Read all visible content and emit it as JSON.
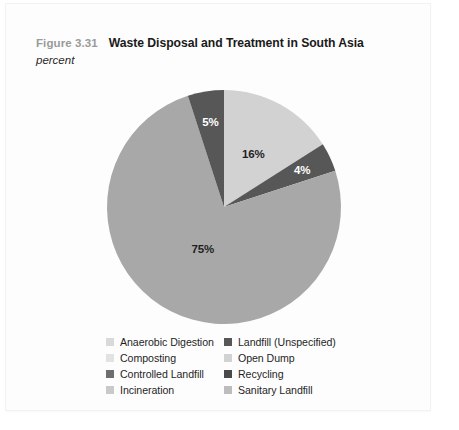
{
  "figure": {
    "number": "Figure 3.31",
    "title": "Waste Disposal and Treatment in South Asia",
    "subtitle": "percent"
  },
  "colors": {
    "light_gray": "#d2d2d2",
    "medium_gray": "#a8a8a8",
    "dark_gray": "#575757",
    "pale_gray": "#cccccc",
    "text_dark": "#1f1f1f",
    "text_gray": "#9a9a9a",
    "background": "#ffffff"
  },
  "chart_data": {
    "type": "pie",
    "title": "Waste Disposal and Treatment in South Asia",
    "subtitle": "percent",
    "units": "percent",
    "start_angle": 0,
    "direction": "clockwise",
    "legend_position": "bottom",
    "labels": [
      "Open Dump",
      "Recycling",
      "Sanitary Landfill",
      "Landfill (Unspecified)"
    ],
    "values": [
      16,
      4,
      75,
      5
    ],
    "slices": [
      {
        "label": "Open Dump",
        "value": 16,
        "display": "16%",
        "color": "#d2d2d2",
        "label_color": "dark"
      },
      {
        "label": "Recycling",
        "value": 4,
        "display": "4%",
        "color": "#575757",
        "label_color": "light"
      },
      {
        "label": "Sanitary Landfill",
        "value": 75,
        "display": "75%",
        "color": "#a8a8a8",
        "label_color": "dark"
      },
      {
        "label": "Landfill (Unspecified)",
        "value": 5,
        "display": "5%",
        "color": "#575757",
        "label_color": "light"
      }
    ]
  },
  "legend": {
    "items": [
      {
        "label": "Anaerobic Digestion",
        "color": "#d9d9d9",
        "column": "left",
        "row": 0
      },
      {
        "label": "Landfill (Unspecified)",
        "color": "#575757",
        "column": "right",
        "row": 0
      },
      {
        "label": "Composting",
        "color": "#e2e2e2",
        "column": "left",
        "row": 1
      },
      {
        "label": "Open Dump",
        "color": "#d2d2d2",
        "column": "right",
        "row": 1
      },
      {
        "label": "Controlled Landfill",
        "color": "#6e6e6e",
        "column": "left",
        "row": 2
      },
      {
        "label": "Recycling",
        "color": "#4a4a4a",
        "column": "right",
        "row": 2
      },
      {
        "label": "Incineration",
        "color": "#c9c9c9",
        "column": "left",
        "row": 3
      },
      {
        "label": "Sanitary Landfill",
        "color": "#bdbdbd",
        "column": "right",
        "row": 3
      }
    ]
  }
}
